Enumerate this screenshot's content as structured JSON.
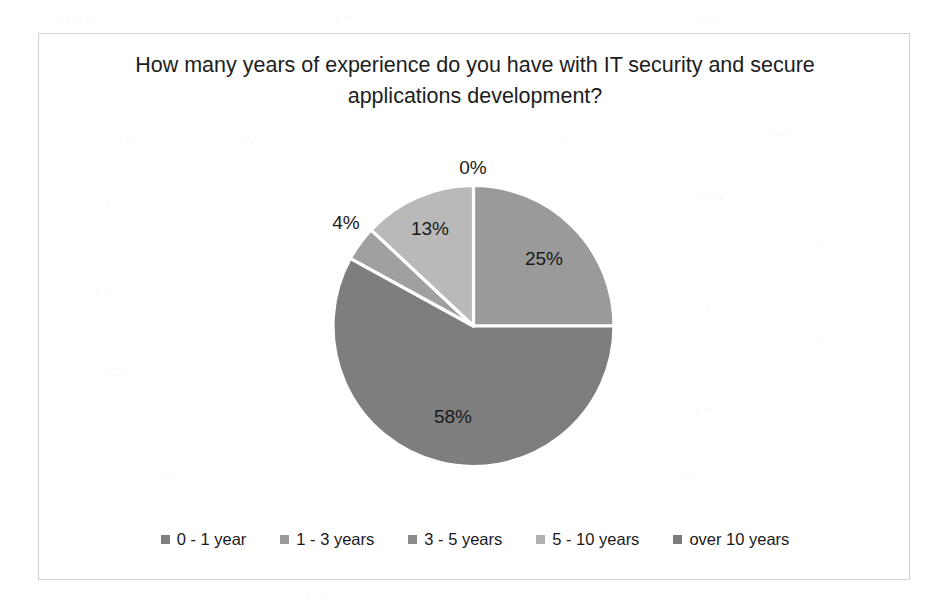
{
  "chart_data": {
    "type": "pie",
    "title": "How many years of experience do you have with IT security and secure applications development?",
    "categories": [
      "0 - 1 year",
      "1 - 3 years",
      "3 - 5 years",
      "5 - 10 years",
      "over 10 years"
    ],
    "values": [
      0,
      25,
      58,
      4,
      13
    ],
    "data_labels": [
      "0%",
      "25%",
      "58%",
      "4%",
      "13%"
    ],
    "colors": [
      "#808080",
      "#9a9a9a",
      "#7e7e7e",
      "#a0a0a0",
      "#b9b9b9"
    ],
    "legend_position": "bottom",
    "grid": false,
    "xlabel": "",
    "ylabel": "",
    "start_angle_deg": 0,
    "direction": "clockwise",
    "separator_color": "#ffffff"
  },
  "chart": {
    "title": "How many years of experience do you have with IT security and secure applications development?",
    "labels": [
      {
        "text": "0%",
        "x": 472,
        "y": 167
      },
      {
        "text": "25%",
        "x": 543,
        "y": 258
      },
      {
        "text": "58%",
        "x": 452,
        "y": 416
      },
      {
        "text": "4%",
        "x": 345,
        "y": 222
      },
      {
        "text": "13%",
        "x": 429,
        "y": 228
      }
    ],
    "legend": [
      {
        "label": "0 - 1 year",
        "color": "#808080"
      },
      {
        "label": "1 - 3 years",
        "color": "#9a9a9a"
      },
      {
        "label": "3 - 5 years",
        "color": "#8a8a8a"
      },
      {
        "label": "5 - 10 years",
        "color": "#b0b0b0"
      },
      {
        "label": "over 10 years",
        "color": "#7c7c7c"
      }
    ]
  }
}
